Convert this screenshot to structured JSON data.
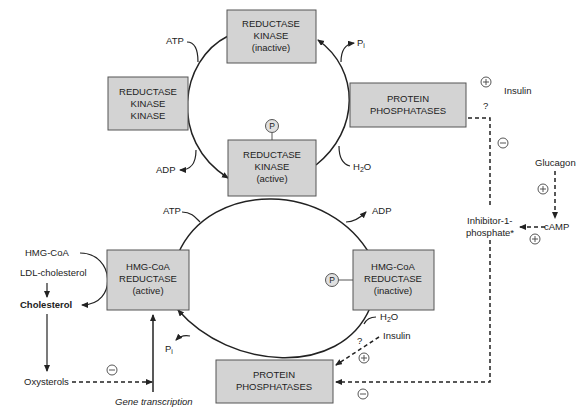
{
  "diagram": {
    "type": "regulation-pathway",
    "boxes": {
      "reductase_kinase_inactive": [
        "REDUCTASE",
        "KINASE",
        "(inactive)"
      ],
      "reductase_kinase_kinase": [
        "REDUCTASE",
        "KINASE",
        "KINASE"
      ],
      "protein_phosphatases_top": [
        "PROTEIN",
        "PHOSPHATASES"
      ],
      "reductase_kinase_active": [
        "REDUCTASE",
        "KINASE",
        "(active)"
      ],
      "hmg_coa_reductase_active": [
        "HMG-CoA",
        "REDUCTASE",
        "(active)"
      ],
      "hmg_coa_reductase_inactive": [
        "HMG-CoA",
        "REDUCTASE",
        "(inactive)"
      ],
      "protein_phosphatases_bottom": [
        "PROTEIN",
        "PHOSPHATASES"
      ]
    },
    "labels": {
      "atp_top": "ATP",
      "pi_top": "P",
      "pi_sub": "i",
      "adp_top": "ADP",
      "h2o_top": "H",
      "h2o_sub": "2",
      "h2o_tail": "O",
      "insulin_top": "Insulin",
      "question_top": "?",
      "glucagon": "Glucagon",
      "camp": "cAMP",
      "inhibitor_line1": "Inhibitor-1-",
      "inhibitor_line2": "phosphate*",
      "atp_bottom": "ATP",
      "adp_bottom": "ADP",
      "hmg_coa": "HMG-CoA",
      "ldl_cholesterol": "LDL-cholesterol",
      "cholesterol": "Cholesterol",
      "oxysterols": "Oxysterols",
      "gene_transcription": "Gene transcription",
      "pi_bottom": "P",
      "h2o_bottom": "H",
      "insulin_bottom": "Insulin",
      "question_bottom": "?",
      "phospho": "P"
    },
    "regulation_signs": {
      "insulin_top": "+",
      "inhibitor_to_phosphatase_top": "-",
      "glucagon_to_camp": "+",
      "camp_to_inhibitor": "+",
      "oxysterols_to_transcription": "-",
      "insulin_bottom": "+",
      "inhibitor_to_phosphatase_bottom": "-"
    }
  }
}
